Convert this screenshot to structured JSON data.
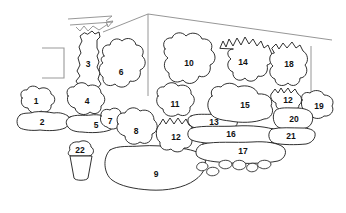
{
  "meta": {
    "background_color": "#ffffff",
    "outline_color": "#1a1a1a",
    "structure_color": "#8a8a8a",
    "width": 346,
    "height": 213
  },
  "regions": [
    {
      "id": 1,
      "label": "1",
      "x": 36,
      "y": 101,
      "kind": "shrub"
    },
    {
      "id": 2,
      "label": "2",
      "x": 42,
      "y": 122,
      "kind": "low-bed"
    },
    {
      "id": 3,
      "label": "3",
      "x": 88,
      "y": 64,
      "kind": "tall-tree"
    },
    {
      "id": 4,
      "label": "4",
      "x": 87,
      "y": 101,
      "kind": "shrub"
    },
    {
      "id": 5,
      "label": "5",
      "x": 96,
      "y": 125,
      "kind": "low-bed"
    },
    {
      "id": 6,
      "label": "6",
      "x": 121,
      "y": 72,
      "kind": "shrub"
    },
    {
      "id": 7,
      "label": "7",
      "x": 110,
      "y": 121,
      "kind": "small-shrub"
    },
    {
      "id": 8,
      "label": "8",
      "x": 136,
      "y": 131,
      "kind": "shrub"
    },
    {
      "id": 9,
      "label": "9",
      "x": 156,
      "y": 174,
      "kind": "large-bed"
    },
    {
      "id": 10,
      "label": "10",
      "x": 189,
      "y": 63,
      "kind": "shrub"
    },
    {
      "id": 11,
      "label": "11",
      "x": 175,
      "y": 104,
      "kind": "shrub"
    },
    {
      "id": 12,
      "label": "12",
      "x": 176,
      "y": 137,
      "kind": "spiky-shrub"
    },
    {
      "id": 13,
      "label": "13",
      "x": 214,
      "y": 122,
      "kind": "low-bed"
    },
    {
      "id": 14,
      "label": "14",
      "x": 243,
      "y": 62,
      "kind": "spiky-shrub"
    },
    {
      "id": 15,
      "label": "15",
      "x": 245,
      "y": 105,
      "kind": "shrub"
    },
    {
      "id": 16,
      "label": "16",
      "x": 231,
      "y": 134,
      "kind": "low-bed"
    },
    {
      "id": 17,
      "label": "17",
      "x": 243,
      "y": 151,
      "kind": "low-bed"
    },
    {
      "id": 18,
      "label": "18",
      "x": 289,
      "y": 64,
      "kind": "spiky-shrub"
    },
    {
      "id": 19,
      "label": "19",
      "x": 319,
      "y": 106,
      "kind": "shrub"
    },
    {
      "id": 20,
      "label": "20",
      "x": 294,
      "y": 119,
      "kind": "shrub"
    },
    {
      "id": 21,
      "label": "21",
      "x": 291,
      "y": 136,
      "kind": "low-bed"
    },
    {
      "id": 12.5,
      "label": "12",
      "x": 288,
      "y": 100,
      "kind": "small-shrub"
    },
    {
      "id": 22,
      "label": "22",
      "x": 80,
      "y": 153,
      "kind": "potted-plant"
    }
  ],
  "structures": {
    "wall_corner_apex": {
      "x": 148,
      "y": 14
    },
    "left_window_frame": true,
    "arrow_marker": true
  },
  "stones": [
    {
      "x": 205,
      "y": 168
    },
    {
      "x": 216,
      "y": 172
    },
    {
      "x": 227,
      "y": 166
    },
    {
      "x": 241,
      "y": 166
    },
    {
      "x": 252,
      "y": 169
    },
    {
      "x": 264,
      "y": 166
    }
  ]
}
